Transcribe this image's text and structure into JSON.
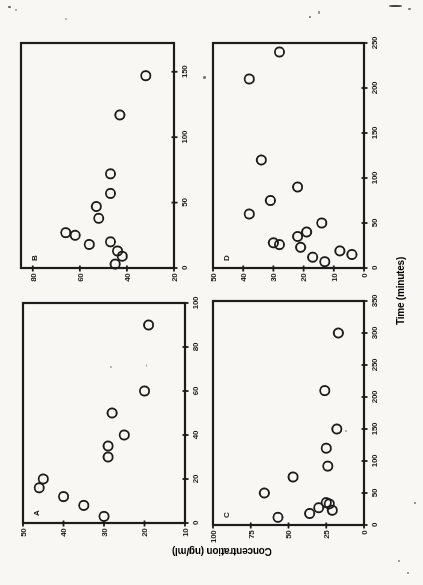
{
  "page": {
    "paper_color": "#f8f7f3",
    "ink_color": "#1c1c1c"
  },
  "figure": {
    "xlabel": "Time (minutes)",
    "ylabel": "Concentration (ng/ml)"
  },
  "chart_data": [
    {
      "id": "A",
      "type": "scatter",
      "panel_label": "A",
      "xlabel": "Time (minutes)",
      "ylabel": "Concentration (ng/ml)",
      "xlim": [
        0,
        100
      ],
      "ylim": [
        10,
        50
      ],
      "xticks": [
        0,
        20,
        40,
        60,
        80,
        100
      ],
      "yticks": [
        10,
        20,
        30,
        40,
        50
      ],
      "grid": false,
      "marker": "open-circle",
      "points": [
        [
          3,
          30
        ],
        [
          8,
          35
        ],
        [
          12,
          40
        ],
        [
          16,
          46
        ],
        [
          20,
          45
        ],
        [
          30,
          29
        ],
        [
          35,
          29
        ],
        [
          40,
          25
        ],
        [
          50,
          28
        ],
        [
          60,
          20
        ],
        [
          90,
          19
        ]
      ]
    },
    {
      "id": "B",
      "type": "scatter",
      "panel_label": "B",
      "xlabel": "Time (minutes)",
      "ylabel": "Concentration (ng/ml)",
      "xlim": [
        0,
        172
      ],
      "ylim": [
        20,
        85
      ],
      "xticks": [
        0,
        50,
        100,
        150
      ],
      "yticks": [
        20,
        40,
        60,
        80
      ],
      "grid": false,
      "marker": "open-circle",
      "points": [
        [
          3,
          45
        ],
        [
          9,
          42
        ],
        [
          13,
          44
        ],
        [
          18,
          56
        ],
        [
          20,
          47
        ],
        [
          25,
          62
        ],
        [
          27,
          66
        ],
        [
          38,
          52
        ],
        [
          47,
          53
        ],
        [
          57,
          47
        ],
        [
          72,
          47
        ],
        [
          117,
          43
        ],
        [
          147,
          32
        ]
      ]
    },
    {
      "id": "C",
      "type": "scatter",
      "panel_label": "C",
      "xlabel": "Time (minutes)",
      "ylabel": "Concentration (ng/ml)",
      "xlim": [
        0,
        350
      ],
      "ylim": [
        0,
        100
      ],
      "xticks": [
        0,
        50,
        100,
        150,
        200,
        250,
        300,
        350
      ],
      "yticks": [
        0,
        25,
        50,
        75,
        100
      ],
      "grid": false,
      "marker": "open-circle",
      "points": [
        [
          12,
          57
        ],
        [
          18,
          36
        ],
        [
          23,
          21
        ],
        [
          27,
          30
        ],
        [
          33,
          23
        ],
        [
          35,
          25
        ],
        [
          50,
          66
        ],
        [
          75,
          47
        ],
        [
          92,
          24
        ],
        [
          120,
          25
        ],
        [
          150,
          18
        ],
        [
          210,
          26
        ],
        [
          300,
          17
        ]
      ]
    },
    {
      "id": "D",
      "type": "scatter",
      "panel_label": "D",
      "xlabel": "Time (minutes)",
      "ylabel": "Concentration (ng/ml)",
      "xlim": [
        0,
        250
      ],
      "ylim": [
        0,
        50
      ],
      "xticks": [
        0,
        50,
        100,
        150,
        200,
        250
      ],
      "yticks": [
        0,
        10,
        20,
        30,
        40,
        50
      ],
      "grid": false,
      "marker": "open-circle",
      "points": [
        [
          7,
          13
        ],
        [
          12,
          17
        ],
        [
          15,
          4
        ],
        [
          19,
          8
        ],
        [
          23,
          21
        ],
        [
          26,
          28
        ],
        [
          28,
          30
        ],
        [
          35,
          22
        ],
        [
          40,
          19
        ],
        [
          50,
          14
        ],
        [
          60,
          38
        ],
        [
          75,
          31
        ],
        [
          90,
          22
        ],
        [
          120,
          34
        ],
        [
          210,
          38
        ],
        [
          240,
          28
        ]
      ]
    }
  ]
}
